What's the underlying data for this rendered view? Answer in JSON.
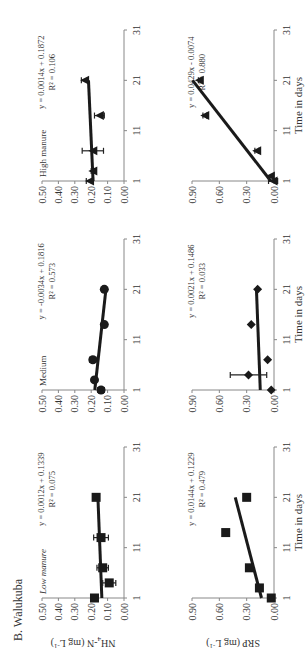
{
  "figure": {
    "section_label": "B. Walukuba",
    "x_axis_label": "Time in days",
    "x_ticks": [
      "1",
      "11",
      "21",
      "31"
    ],
    "rows": [
      {
        "id": "nh4",
        "y_label_main": "NH",
        "y_label_sub": "4",
        "y_label_rest": "-N (mg L",
        "y_label_sup": "-1",
        "y_label_end": ")",
        "y_ticks": [
          "0.00",
          "0.10",
          "0.20",
          "0.30",
          "0.40",
          "0.50"
        ]
      },
      {
        "id": "srp",
        "y_label_main": "SRP (mg L",
        "y_label_sup": "-1",
        "y_label_end": ")",
        "y_ticks": [
          "0.00",
          "0.30",
          "0.60",
          "0.90"
        ]
      }
    ],
    "columns": [
      {
        "title": "Low manure"
      },
      {
        "title": "Medium"
      },
      {
        "title": "High manure"
      }
    ]
  },
  "chart_data": [
    {
      "type": "scatter",
      "panel": "NH4-N Low manure",
      "title": "Low manure",
      "xlabel": "",
      "ylabel": "NH4-N (mg L-1)",
      "xlim": [
        1,
        31
      ],
      "ylim": [
        0,
        0.5
      ],
      "x": [
        1,
        4,
        7,
        13,
        21
      ],
      "y": [
        0.18,
        0.09,
        0.13,
        0.14,
        0.17
      ],
      "yerr": [
        0.0,
        0.04,
        0.035,
        0.045,
        0.01
      ],
      "marker": "square",
      "trendline": {
        "equation": "y = 0.0012x + 0.1339",
        "r2": "R² = 0.075",
        "slope": 0.0012,
        "intercept": 0.1339
      }
    },
    {
      "type": "scatter",
      "panel": "NH4-N Medium",
      "title": "Medium",
      "xlabel": "",
      "ylabel": "",
      "xlim": [
        1,
        31
      ],
      "ylim": [
        0,
        0.5
      ],
      "x": [
        1,
        3,
        7,
        14,
        21
      ],
      "y": [
        0.14,
        0.18,
        0.19,
        0.12,
        0.12
      ],
      "yerr": [
        0.02,
        0.01,
        0.02,
        0.01,
        0.01
      ],
      "marker": "circle",
      "trendline": {
        "equation": "y = -0.0034x + 0.1816",
        "r2": "R² = 0.573",
        "slope": -0.0034,
        "intercept": 0.1816
      }
    },
    {
      "type": "scatter",
      "panel": "NH4-N High manure",
      "title": "High manure",
      "xlabel": "",
      "ylabel": "",
      "xlim": [
        1,
        31
      ],
      "ylim": [
        0,
        0.5
      ],
      "x": [
        1,
        3,
        7,
        14,
        21
      ],
      "y": [
        0.21,
        0.19,
        0.19,
        0.15,
        0.24
      ],
      "yerr": [
        0.02,
        0.01,
        0.065,
        0.03,
        0.02
      ],
      "marker": "triangle",
      "trendline": {
        "equation": "y = 0.0014x + 0.1872",
        "r2": "R² = 0.106",
        "slope": 0.0014,
        "intercept": 0.1872
      }
    },
    {
      "type": "scatter",
      "panel": "SRP Low manure",
      "title": "",
      "xlabel": "Time in days",
      "ylabel": "SRP (mg L-1)",
      "xlim": [
        1,
        31
      ],
      "ylim": [
        0,
        0.9
      ],
      "x": [
        1,
        3,
        7,
        14,
        21
      ],
      "y": [
        0.03,
        0.16,
        0.27,
        0.53,
        0.3
      ],
      "yerr": [
        0.0,
        0.0,
        0.0,
        0.0,
        0.0
      ],
      "marker": "square",
      "trendline": {
        "equation": "y = 0.0144x + 0.1229",
        "r2": "R² = 0.479",
        "slope": 0.0144,
        "intercept": 0.1229
      }
    },
    {
      "type": "scatter",
      "panel": "SRP Medium",
      "title": "",
      "xlabel": "Time in days",
      "ylabel": "",
      "xlim": [
        1,
        31
      ],
      "ylim": [
        0,
        0.9
      ],
      "x": [
        1,
        4,
        7,
        14,
        21
      ],
      "y": [
        0.03,
        0.28,
        0.07,
        0.25,
        0.18
      ],
      "yerr": [
        0.0,
        0.2,
        0.0,
        0.0,
        0.01
      ],
      "marker": "diamond",
      "trendline": {
        "equation": "y = 0.0021x + 0.1486",
        "r2": "R² = 0.033",
        "slope": 0.0021,
        "intercept": 0.1486
      }
    },
    {
      "type": "scatter",
      "panel": "SRP High manure",
      "title": "",
      "xlabel": "Time in days",
      "ylabel": "",
      "xlim": [
        1,
        31
      ],
      "ylim": [
        0,
        0.9
      ],
      "x": [
        1,
        2,
        7,
        14,
        21
      ],
      "y": [
        0.01,
        0.04,
        0.19,
        0.76,
        0.82
      ],
      "yerr": [
        0.05,
        0.0,
        0.02,
        0.02,
        0.01
      ],
      "marker": "triangle",
      "trendline": {
        "equation": "y = 0.0429x - 0.0074",
        "r2": "R² = 0.880",
        "slope": 0.0429,
        "intercept": -0.0074
      }
    }
  ]
}
